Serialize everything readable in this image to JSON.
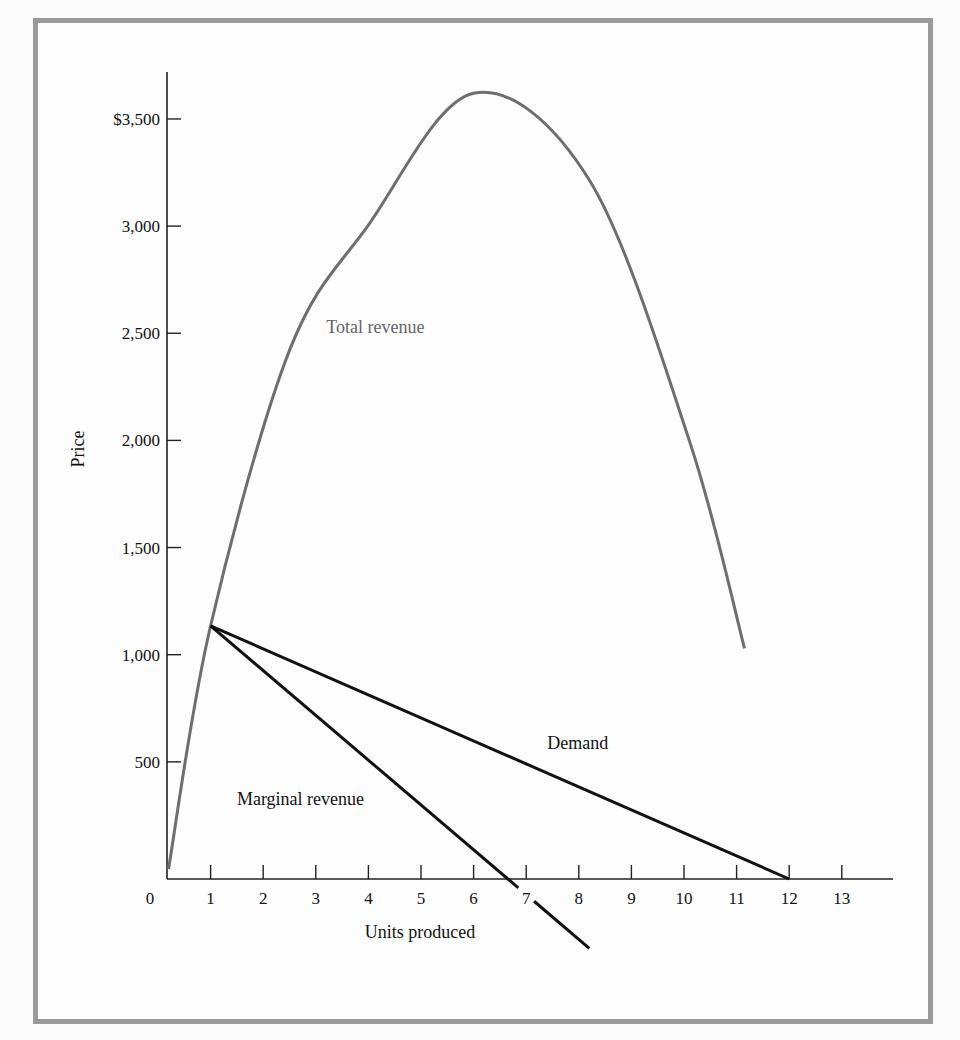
{
  "chart_data": {
    "type": "line",
    "title": "",
    "xlabel": "Units produced",
    "ylabel": "Price",
    "xlim": [
      0,
      14
    ],
    "ylim": [
      -400,
      3700
    ],
    "grid": false,
    "x_ticks": [
      {
        "value": 0,
        "label": "0"
      },
      {
        "value": 1,
        "label": "1"
      },
      {
        "value": 2,
        "label": "2"
      },
      {
        "value": 3,
        "label": "3"
      },
      {
        "value": 4,
        "label": "4"
      },
      {
        "value": 5,
        "label": "5"
      },
      {
        "value": 6,
        "label": "6"
      },
      {
        "value": 7,
        "label": "7"
      },
      {
        "value": 8,
        "label": "8"
      },
      {
        "value": 9,
        "label": "9"
      },
      {
        "value": 10,
        "label": "10"
      },
      {
        "value": 11,
        "label": "11"
      },
      {
        "value": 12,
        "label": "12"
      },
      {
        "value": 13,
        "label": "13"
      }
    ],
    "y_ticks": [
      {
        "value": 500,
        "label": "500"
      },
      {
        "value": 1000,
        "label": "1,000"
      },
      {
        "value": 1500,
        "label": "1,500"
      },
      {
        "value": 2000,
        "label": "2,000"
      },
      {
        "value": 2500,
        "label": "2,500"
      },
      {
        "value": 3000,
        "label": "3,000"
      },
      {
        "value": 3500,
        "label": "$3,500"
      }
    ],
    "series": [
      {
        "name": "Total revenue",
        "label": "Total revenue",
        "color": "#6e6e6e",
        "smooth": true,
        "points": [
          [
            0.2,
            0
          ],
          [
            1,
            1135
          ],
          [
            2.5,
            2420
          ],
          [
            4,
            3005
          ],
          [
            6,
            3620
          ],
          [
            8.2,
            3215
          ],
          [
            10.1,
            2000
          ],
          [
            11.15,
            1030
          ]
        ],
        "label_at": [
          3.2,
          2500
        ]
      },
      {
        "name": "Demand",
        "label": "Demand",
        "color": "#111111",
        "smooth": false,
        "points": [
          [
            1,
            1135
          ],
          [
            12,
            0
          ]
        ],
        "label_at": [
          7.4,
          560
        ]
      },
      {
        "name": "Marginal revenue",
        "label": "Marginal revenue",
        "color": "#111111",
        "smooth": false,
        "points": [
          [
            1,
            1135
          ],
          [
            8.2,
            -370
          ]
        ],
        "gap_x": [
          6.85,
          7.15
        ],
        "label_at": [
          1.5,
          300
        ]
      }
    ]
  }
}
